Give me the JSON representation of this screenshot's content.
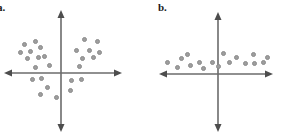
{
  "figure": {
    "title": "",
    "background_color": "#ffffff",
    "width": 282,
    "height": 138,
    "panels": [
      {
        "id": "a",
        "label": "a.",
        "label_position": {
          "x": -3,
          "y": 2
        },
        "axis_color": "#6b6b6b",
        "dot_fill": "#9d9d9d",
        "dot_stroke": "#8b8b8b",
        "dot_radius_px": 2.5,
        "origin": {
          "x": 61,
          "y": 73
        },
        "x_axis": {
          "x_start": 5,
          "x_end": 121,
          "y": 73
        },
        "y_axis": {
          "y_start": 11,
          "y_end": 131,
          "x": 61
        },
        "chart_data": {
          "type": "scatter",
          "title": "",
          "xlabel": "",
          "ylabel": "",
          "grid": false,
          "legend": false,
          "axis_style": "four-arrow-cartesian",
          "description": "Scatter plot with no linear correlation; points form two separated clusters in the upper-left and upper-right/right regions with a dip near the origin.",
          "correlation": "no correlation",
          "xlim": [
            -56,
            60
          ],
          "ylim": [
            -58,
            62
          ],
          "n_points": 26,
          "points_px": [
            {
              "x": 24,
              "y": 44
            },
            {
              "x": 35,
              "y": 41
            },
            {
              "x": 20,
              "y": 52
            },
            {
              "x": 30,
              "y": 51
            },
            {
              "x": 40,
              "y": 47
            },
            {
              "x": 27,
              "y": 58
            },
            {
              "x": 38,
              "y": 57
            },
            {
              "x": 44,
              "y": 56
            },
            {
              "x": 35,
              "y": 67
            },
            {
              "x": 49,
              "y": 65
            },
            {
              "x": 32,
              "y": 79
            },
            {
              "x": 41,
              "y": 78
            },
            {
              "x": 47,
              "y": 87
            },
            {
              "x": 40,
              "y": 94
            },
            {
              "x": 56,
              "y": 97
            },
            {
              "x": 84,
              "y": 39
            },
            {
              "x": 97,
              "y": 41
            },
            {
              "x": 76,
              "y": 50
            },
            {
              "x": 89,
              "y": 50
            },
            {
              "x": 99,
              "y": 52
            },
            {
              "x": 82,
              "y": 58
            },
            {
              "x": 93,
              "y": 57
            },
            {
              "x": 79,
              "y": 66
            },
            {
              "x": 71,
              "y": 80
            },
            {
              "x": 81,
              "y": 79
            },
            {
              "x": 70,
              "y": 90
            }
          ],
          "points_data": [
            {
              "x": -37,
              "y": 29
            },
            {
              "x": -26,
              "y": 32
            },
            {
              "x": -41,
              "y": 21
            },
            {
              "x": -31,
              "y": 22
            },
            {
              "x": -21,
              "y": 26
            },
            {
              "x": -34,
              "y": 15
            },
            {
              "x": -23,
              "y": 16
            },
            {
              "x": -17,
              "y": 17
            },
            {
              "x": -26,
              "y": 6
            },
            {
              "x": -12,
              "y": 8
            },
            {
              "x": -29,
              "y": -6
            },
            {
              "x": -20,
              "y": -5
            },
            {
              "x": -14,
              "y": -14
            },
            {
              "x": -21,
              "y": -21
            },
            {
              "x": -5,
              "y": -24
            },
            {
              "x": 23,
              "y": 34
            },
            {
              "x": 36,
              "y": 32
            },
            {
              "x": 15,
              "y": 23
            },
            {
              "x": 28,
              "y": 23
            },
            {
              "x": 38,
              "y": 21
            },
            {
              "x": 21,
              "y": 15
            },
            {
              "x": 32,
              "y": 16
            },
            {
              "x": 18,
              "y": 7
            },
            {
              "x": 10,
              "y": -7
            },
            {
              "x": 20,
              "y": -6
            },
            {
              "x": 9,
              "y": -17
            }
          ]
        }
      },
      {
        "id": "b",
        "label": "b.",
        "label_position": {
          "x": 17,
          "y": 2
        },
        "axis_color": "#6b6b6b",
        "dot_fill": "#9d9d9d",
        "dot_stroke": "#8b8b8b",
        "dot_radius_px": 2.5,
        "origin": {
          "x": 77,
          "y": 74
        },
        "x_axis": {
          "x_start": 19,
          "x_end": 131,
          "y": 74
        },
        "y_axis": {
          "y_start": 13,
          "y_end": 131,
          "x": 77
        },
        "chart_data": {
          "type": "scatter",
          "title": "",
          "xlabel": "",
          "ylabel": "",
          "grid": false,
          "legend": false,
          "axis_style": "four-arrow-cartesian",
          "description": "Scatter plot with no correlation; points lie in a flat horizontal band slightly above the x-axis, spread evenly across both negative and positive x.",
          "correlation": "no correlation",
          "xlim": [
            -58,
            54
          ],
          "ylim": [
            -57,
            61
          ],
          "n_points": 17,
          "points_px": [
            {
              "x": 26,
              "y": 62
            },
            {
              "x": 40,
              "y": 58
            },
            {
              "x": 36,
              "y": 67
            },
            {
              "x": 49,
              "y": 65
            },
            {
              "x": 46,
              "y": 54
            },
            {
              "x": 58,
              "y": 62
            },
            {
              "x": 62,
              "y": 68
            },
            {
              "x": 71,
              "y": 62
            },
            {
              "x": 77,
              "y": 66
            },
            {
              "x": 82,
              "y": 53
            },
            {
              "x": 88,
              "y": 62
            },
            {
              "x": 95,
              "y": 57
            },
            {
              "x": 104,
              "y": 63
            },
            {
              "x": 112,
              "y": 54
            },
            {
              "x": 113,
              "y": 63
            },
            {
              "x": 122,
              "y": 62
            },
            {
              "x": 126,
              "y": 57
            }
          ],
          "points_data": [
            {
              "x": -51,
              "y": 12
            },
            {
              "x": -37,
              "y": 16
            },
            {
              "x": -41,
              "y": 7
            },
            {
              "x": -28,
              "y": 9
            },
            {
              "x": -31,
              "y": 20
            },
            {
              "x": -19,
              "y": 12
            },
            {
              "x": -15,
              "y": 6
            },
            {
              "x": -6,
              "y": 12
            },
            {
              "x": 0,
              "y": 8
            },
            {
              "x": 5,
              "y": 21
            },
            {
              "x": 11,
              "y": 12
            },
            {
              "x": 18,
              "y": 17
            },
            {
              "x": 27,
              "y": 11
            },
            {
              "x": 35,
              "y": 20
            },
            {
              "x": 36,
              "y": 11
            },
            {
              "x": 45,
              "y": 12
            },
            {
              "x": 49,
              "y": 17
            }
          ]
        }
      }
    ]
  }
}
